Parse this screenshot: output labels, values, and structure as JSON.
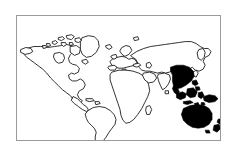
{
  "figure": {
    "caption": "Outline world map; Asia-Pacific region shaded solid black",
    "background_color": "#ffffff",
    "frame": {
      "visible": true,
      "color": "#9a9a9a",
      "line_width_px": 1,
      "x": 16,
      "y": 15,
      "width": 205,
      "height": 126
    }
  },
  "map": {
    "projection_hint": "equirectangular",
    "outline_color": "#1a1a1a",
    "outline_width_px": 0.9,
    "fill_color": "#ffffff",
    "highlight_color": "#000000",
    "viewbox": "0 0 205 126",
    "landmasses": [
      {
        "name": "north-america",
        "highlighted": false
      },
      {
        "name": "greenland",
        "highlighted": false
      },
      {
        "name": "canadian-arctic-islands",
        "highlighted": false
      },
      {
        "name": "central-america",
        "highlighted": false
      },
      {
        "name": "south-america",
        "highlighted": false
      },
      {
        "name": "europe",
        "highlighted": false
      },
      {
        "name": "africa",
        "highlighted": false
      },
      {
        "name": "madagascar",
        "highlighted": false
      },
      {
        "name": "asia-russia",
        "highlighted": false
      },
      {
        "name": "kamchatka",
        "highlighted": false
      },
      {
        "name": "india",
        "highlighted": false
      },
      {
        "name": "arabian-peninsula",
        "highlighted": false
      },
      {
        "name": "southeast-asia",
        "highlighted": true
      },
      {
        "name": "indonesia",
        "highlighted": true
      },
      {
        "name": "philippines",
        "highlighted": true
      },
      {
        "name": "new-guinea",
        "highlighted": true
      },
      {
        "name": "australia",
        "highlighted": true
      },
      {
        "name": "new-zealand",
        "highlighted": true
      },
      {
        "name": "tasmania",
        "highlighted": true
      }
    ],
    "highlight_summary": {
      "label": "Asia-Pacific",
      "region_count": 7
    }
  }
}
